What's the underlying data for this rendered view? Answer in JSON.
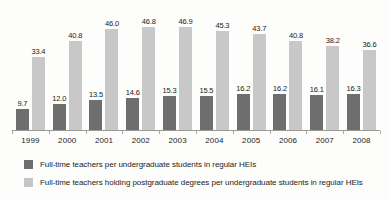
{
  "chart_data": {
    "type": "bar",
    "title": "",
    "xlabel": "",
    "ylabel": "",
    "grid": false,
    "ylim": [
      0,
      52
    ],
    "legend_position": "bottom-left",
    "categories": [
      "1999",
      "2000",
      "2001",
      "2002",
      "2003",
      "2004",
      "2005",
      "2006",
      "2007",
      "2008"
    ],
    "series": [
      {
        "name": "Full-time teachers per undergraduate students in regular HEIs",
        "color": "#6e6e6e",
        "values": [
          9.7,
          12.0,
          13.5,
          14.6,
          15.3,
          15.5,
          16.2,
          16.2,
          16.1,
          16.3
        ],
        "labels": [
          "9.7",
          "12.0",
          "13.5",
          "14.6",
          "15.3",
          "15.5",
          "16.2",
          "16.2",
          "16.1",
          "16.3"
        ]
      },
      {
        "name": "Full-time teachers holding postgraduate degrees per undergraduate students in regular HEIs",
        "color": "#c8c8c8",
        "values": [
          33.4,
          40.8,
          46.0,
          46.8,
          46.9,
          45.3,
          43.7,
          40.8,
          38.2,
          36.6
        ],
        "labels": [
          "33.4",
          "40.8",
          "46.0",
          "46.8",
          "46.9",
          "45.3",
          "43.7",
          "40.8",
          "38.2",
          "36.6"
        ]
      }
    ]
  },
  "legend": {
    "items": [
      {
        "label": "Full-time teachers per undergraduate students in regular HEIs",
        "color": "#6e6e6e"
      },
      {
        "label": "Full-time teachers holding postgraduate degrees per undergraduate students in regular HEIs",
        "color": "#c5c5c5"
      }
    ]
  },
  "axis": {
    "baseline_color": "#9a9a94"
  }
}
